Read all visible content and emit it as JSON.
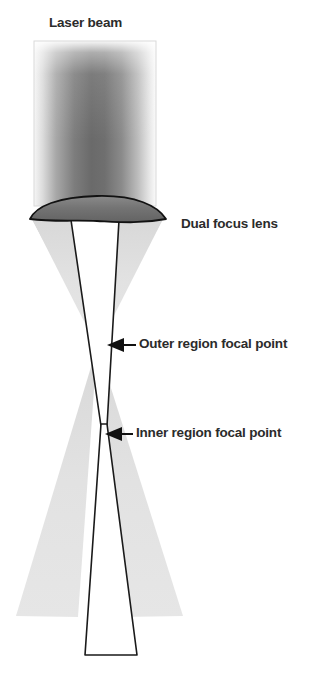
{
  "figure": {
    "width": 314,
    "height": 682,
    "background_color": "#ffffff"
  },
  "labels": {
    "laser_beam": "Laser beam",
    "dual_focus_lens": "Dual focus lens",
    "outer_region_focal_point": "Outer region focal point",
    "inner_region_focal_point": "Inner region focal point"
  },
  "colors": {
    "text": "#2b2b2b",
    "lens_fill": "#6f6f6f",
    "lens_stroke": "#111111",
    "outer_cone_fill": "#e2e2e2",
    "inner_cone_stroke": "#1a1a1a",
    "inner_cone_fill": "#ffffff",
    "beam_dark": "#6b6b6b",
    "beam_light": "#f2f2f2",
    "arrow_fill": "#111111"
  },
  "geometry": {
    "beam_rect": {
      "x": 34,
      "y": 41,
      "width": 122,
      "height": 164
    },
    "lens": {
      "left_x": 30,
      "right_x": 165,
      "top_y": 196,
      "bottom_y": 222
    },
    "outer_focal_point": {
      "x": 96,
      "y": 345
    },
    "inner_focal_point": {
      "x": 104,
      "y": 425
    },
    "inner_cone_bottom": {
      "left_x": 85,
      "right_x": 137,
      "y": 655
    },
    "outer_cone_bottom_y": 615
  },
  "icons": {
    "outer_arrow": "left-arrow-icon",
    "inner_arrow": "left-arrow-icon"
  }
}
